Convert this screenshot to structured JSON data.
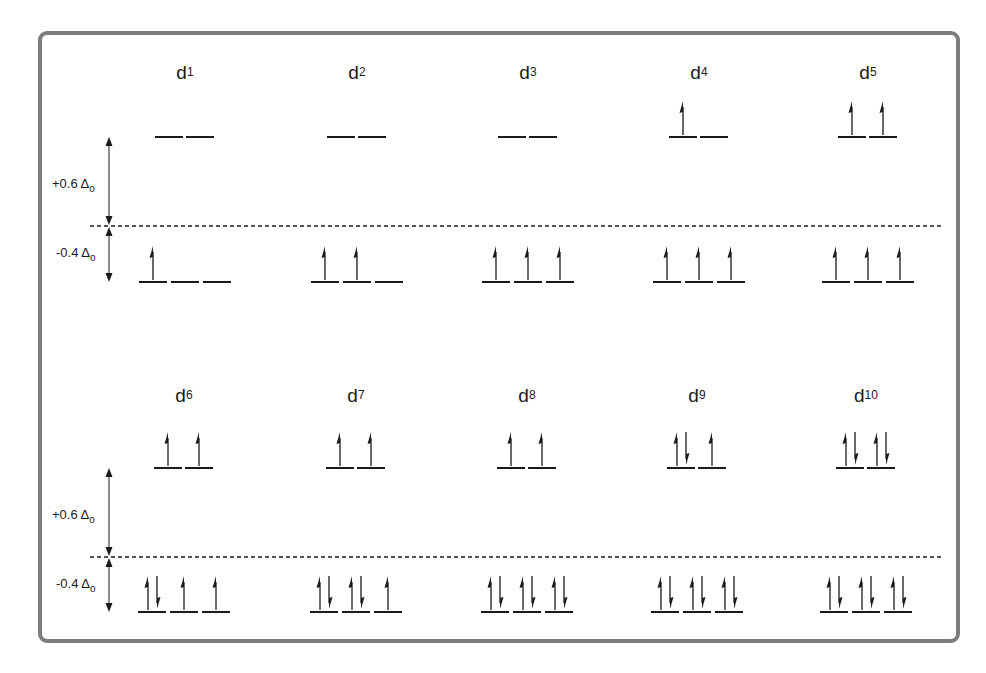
{
  "diagram": {
    "colors": {
      "frame": "#7d7d7d",
      "ink": "#1a1a1a",
      "background": "#ffffff"
    },
    "energy_labels": {
      "upper": {
        "prefix": "+0.6 ",
        "symbol": "Δ",
        "subscript": "o"
      },
      "lower": {
        "prefix": "-0.4 ",
        "symbol": "Δ",
        "subscript": "o"
      }
    },
    "panels": [
      {
        "name": "top-row",
        "barycenter_y": 226,
        "eg_y": 137,
        "t2g_y": 282,
        "configs": [
          {
            "label": "d",
            "sup": "1",
            "cx": 185,
            "eg": [
              0,
              0
            ],
            "t2g": [
              1,
              0,
              0
            ]
          },
          {
            "label": "d",
            "sup": "2",
            "cx": 357,
            "eg": [
              0,
              0
            ],
            "t2g": [
              1,
              1,
              0
            ]
          },
          {
            "label": "d",
            "sup": "3",
            "cx": 528,
            "eg": [
              0,
              0
            ],
            "t2g": [
              1,
              1,
              1
            ]
          },
          {
            "label": "d",
            "sup": "4",
            "cx": 699,
            "eg": [
              1,
              0
            ],
            "t2g": [
              1,
              1,
              1
            ]
          },
          {
            "label": "d",
            "sup": "5",
            "cx": 868,
            "eg": [
              1,
              1
            ],
            "t2g": [
              1,
              1,
              1
            ]
          }
        ]
      },
      {
        "name": "bottom-row",
        "barycenter_y": 557,
        "eg_y": 468,
        "t2g_y": 612,
        "configs": [
          {
            "label": "d",
            "sup": "6",
            "cx": 184,
            "eg": [
              1,
              1
            ],
            "t2g": [
              2,
              1,
              1
            ]
          },
          {
            "label": "d",
            "sup": "7",
            "cx": 356,
            "eg": [
              1,
              1
            ],
            "t2g": [
              2,
              2,
              1
            ]
          },
          {
            "label": "d",
            "sup": "8",
            "cx": 527,
            "eg": [
              1,
              1
            ],
            "t2g": [
              2,
              2,
              2
            ]
          },
          {
            "label": "d",
            "sup": "9",
            "cx": 697,
            "eg": [
              2,
              1
            ],
            "t2g": [
              2,
              2,
              2
            ]
          },
          {
            "label": "d",
            "sup": "10",
            "cx": 866,
            "eg": [
              2,
              2
            ],
            "t2g": [
              2,
              2,
              2
            ]
          }
        ]
      }
    ]
  }
}
